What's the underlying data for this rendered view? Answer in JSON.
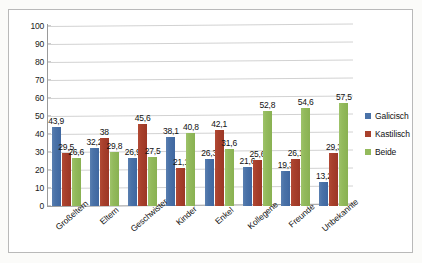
{
  "chart_data": {
    "type": "bar",
    "title": "",
    "subtitle": "",
    "xlabel": "",
    "ylabel": "",
    "ylim": [
      0,
      100
    ],
    "yticks": [
      0,
      10,
      20,
      30,
      40,
      50,
      60,
      70,
      80,
      90,
      100
    ],
    "grid": true,
    "legend_position": "right",
    "decimal_separator": ",",
    "categories": [
      "Großeltern",
      "Eltern",
      "Geschwister",
      "Kinder",
      "Enkel",
      "Kollegene",
      "Freunde",
      "Unbekannte"
    ],
    "series": [
      {
        "name": "Galicisch",
        "color": "#4a72a8",
        "values": [
          43.9,
          32.2,
          26.9,
          38.1,
          26.3,
          21.6,
          19.3,
          13.2
        ],
        "labels": [
          "43,9",
          "32,2",
          "26,9",
          "38,1",
          "26,3",
          "21,6",
          "19,3",
          "13,2"
        ]
      },
      {
        "name": "Kastilisch",
        "color": "#a8402c",
        "values": [
          29.5,
          38.0,
          45.6,
          21.1,
          42.1,
          25.6,
          26.1,
          29.3
        ],
        "labels": [
          "29,5",
          "38",
          "45,6",
          "21,1",
          "42,1",
          "25,6",
          "26,1",
          "29,3"
        ]
      },
      {
        "name": "Beide",
        "color": "#93ba5c",
        "values": [
          26.6,
          29.8,
          27.5,
          40.8,
          31.6,
          52.8,
          54.6,
          57.5
        ],
        "labels": [
          "26,6",
          "29,8",
          "27,5",
          "40,8",
          "31,6",
          "52,8",
          "54,6",
          "57,5"
        ]
      }
    ]
  }
}
